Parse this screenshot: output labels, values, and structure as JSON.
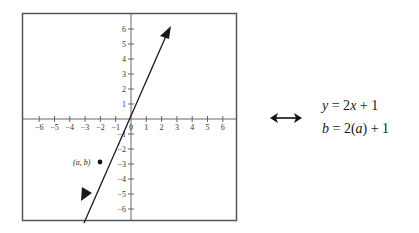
{
  "graph": {
    "x_ticks": [
      "-6",
      "-5",
      "-4",
      "-3",
      "-2",
      "-1",
      "0",
      "1",
      "2",
      "3",
      "4",
      "5",
      "6"
    ],
    "y_ticks_pos": [
      "1",
      "2",
      "3",
      "4",
      "5",
      "6"
    ],
    "y_ticks_neg": [
      "-1",
      "-2",
      "-3",
      "-4",
      "-5",
      "-6"
    ],
    "line_equation": "y = 2x + 1",
    "point_label": "(a, b)",
    "point": {
      "x": -2,
      "y": -3
    },
    "line_color": "#1a1a1a",
    "frame_color": "#555555"
  },
  "equivalence_symbol": "double-arrow",
  "equations": {
    "eq1": {
      "lhs": "y",
      "mid": " = 2",
      "var": "x",
      "rhs": " + 1"
    },
    "eq2": {
      "lhs": "b",
      "mid": " = 2(",
      "var": "a",
      "rhs": ") + 1"
    }
  }
}
